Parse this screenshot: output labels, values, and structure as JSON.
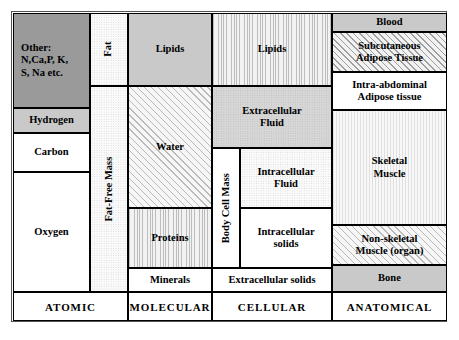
{
  "figure": {
    "levels": [
      "ATOMIC",
      "MOLECULAR",
      "CELLULAR",
      "ANATOMICAL"
    ]
  },
  "colors": {
    "dark_gray": "#9a9a9a",
    "mid_gray": "#c9c9c9",
    "light_gray": "#d8d8d8",
    "white": "#ffffff",
    "border": "#000000",
    "frame": "#555555"
  },
  "atomic": {
    "level_label": "ATOMIC",
    "cells": [
      {
        "id": "other",
        "label": "Other:\nN,Ca,P, K,\nS, Na etc.",
        "fill": "dark-gray"
      },
      {
        "id": "hydrogen",
        "label": "Hydrogen",
        "fill": "light-gray"
      },
      {
        "id": "carbon",
        "label": "Carbon",
        "fill": "white"
      },
      {
        "id": "oxygen",
        "label": "Oxygen",
        "fill": "white"
      }
    ]
  },
  "molecular": {
    "level_label": "MOLECULAR",
    "cells": [
      {
        "id": "fat",
        "label": "Fat",
        "fill": "dotted-light",
        "orientation": "vertical"
      },
      {
        "id": "fat-free-mass",
        "label": "Fat-Free Mass",
        "fill": "dotted-light",
        "orientation": "vertical"
      },
      {
        "id": "lipids",
        "label": "Lipids",
        "fill": "mid-gray"
      },
      {
        "id": "water",
        "label": "Water",
        "fill": "diagonal-hatch"
      },
      {
        "id": "proteins",
        "label": "Proteins",
        "fill": "vertical-lines"
      },
      {
        "id": "minerals",
        "label": "Minerals",
        "fill": "white"
      }
    ]
  },
  "cellular": {
    "level_label": "CELLULAR",
    "cells": [
      {
        "id": "lipids-cellular",
        "label": "Lipids",
        "fill": "vertical-lines"
      },
      {
        "id": "extracellular-fluid",
        "label": "Extracellular\nFluid",
        "fill": "gray-dotted"
      },
      {
        "id": "body-cell-mass",
        "label": "Body Cell Mass",
        "fill": "white",
        "orientation": "vertical"
      },
      {
        "id": "intracellular-fluid",
        "label": "Intracellular\nFluid",
        "fill": "dotted-light"
      },
      {
        "id": "intracellular-solids",
        "label": "Intracellular\nsolids",
        "fill": "white"
      },
      {
        "id": "extracellular-solids",
        "label": "Extracellular solids",
        "fill": "white"
      }
    ]
  },
  "anatomical": {
    "level_label": "ANATOMICAL",
    "cells": [
      {
        "id": "blood",
        "label": "Blood",
        "fill": "light-gray"
      },
      {
        "id": "subcutaneous-adipose",
        "label": "Subcutaneous\nAdipose Tissue",
        "fill": "diagonal-hatch-strong"
      },
      {
        "id": "intra-abdominal-adipose",
        "label": "Intra-abdominal\nAdipose tissue",
        "fill": "white"
      },
      {
        "id": "skeletal-muscle",
        "label": "Skeletal\nMuscle",
        "fill": "vertical-lines-faint"
      },
      {
        "id": "non-skeletal-muscle",
        "label": "Non-skeletal\nMuscle (organ)",
        "fill": "diagonal-hatch"
      },
      {
        "id": "bone",
        "label": "Bone",
        "fill": "mid-gray"
      }
    ]
  }
}
